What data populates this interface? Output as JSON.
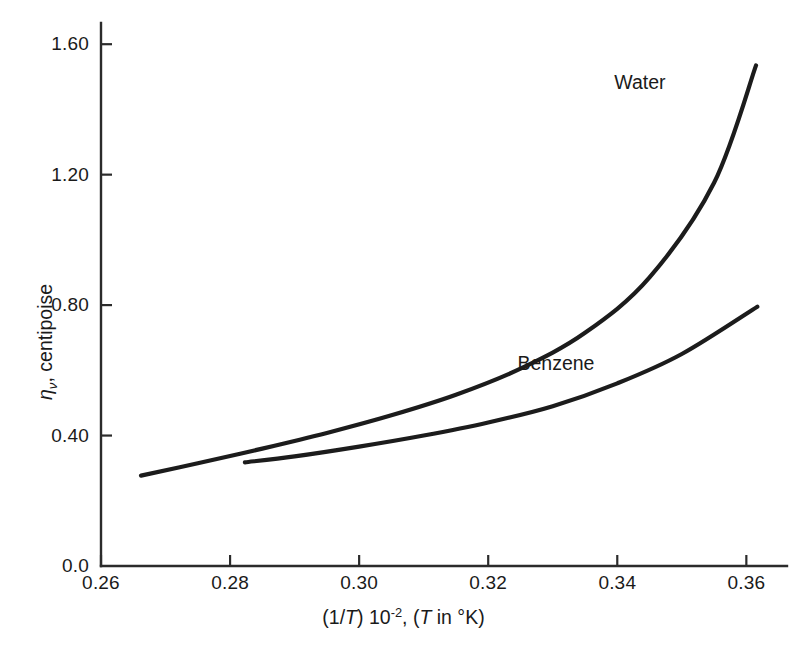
{
  "chart_data": {
    "type": "line",
    "title": "",
    "subtitle": "",
    "xlabel_parts": {
      "prefix": "(1/",
      "var1": "T",
      "mid": ") 10",
      "exponent": "-2",
      "comma": ", (",
      "var2": "T",
      "suffix": " in °K)"
    },
    "xlabel_plain": "(1/T) 10⁻², (T in °K)",
    "ylabel_parts": {
      "symbol": "η",
      "subscript": "ν",
      "rest": ", centipoise"
    },
    "ylabel_plain": "ην, centipoise",
    "xlim": [
      0.26,
      0.3663
    ],
    "ylim": [
      0.0,
      1.665
    ],
    "xticks": [
      0.26,
      0.28,
      0.3,
      0.32,
      0.34,
      0.36
    ],
    "xtick_labels": [
      "0.26",
      "0.28",
      "0.30",
      "0.32",
      "0.34",
      "0.36"
    ],
    "yticks": [
      0.0,
      0.4,
      0.8,
      1.2,
      1.6
    ],
    "ytick_labels": [
      "0.0",
      "0.40",
      "0.80",
      "1.20",
      "1.60"
    ],
    "grid": false,
    "legend": "inline-annotations",
    "line_color": "#1c1c1c",
    "series": [
      {
        "name": "Water",
        "label": "Water",
        "label_x": 0.3435,
        "label_y": 1.485,
        "x": [
          0.2662,
          0.275,
          0.285,
          0.295,
          0.305,
          0.315,
          0.325,
          0.335,
          0.345,
          0.355,
          0.3615
        ],
        "y": [
          0.277,
          0.315,
          0.36,
          0.408,
          0.462,
          0.525,
          0.605,
          0.715,
          0.885,
          1.175,
          1.535
        ]
      },
      {
        "name": "Benzene",
        "label": "Benzene",
        "label_x": 0.3305,
        "label_y": 0.622,
        "x": [
          0.2823,
          0.29,
          0.3,
          0.31,
          0.32,
          0.33,
          0.34,
          0.35,
          0.3617
        ],
        "y": [
          0.318,
          0.336,
          0.366,
          0.4,
          0.44,
          0.49,
          0.56,
          0.65,
          0.795
        ]
      }
    ]
  }
}
